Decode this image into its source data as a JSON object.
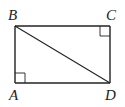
{
  "diagram": {
    "type": "rectangle-with-diagonal",
    "stroke_color": "#222222",
    "background": "#ffffff",
    "vertices": {
      "A": {
        "label": "A",
        "x": 15,
        "y": 83
      },
      "B": {
        "label": "B",
        "x": 15,
        "y": 26
      },
      "C": {
        "label": "C",
        "x": 110,
        "y": 26
      },
      "D": {
        "label": "D",
        "x": 110,
        "y": 83
      }
    },
    "segments": [
      "AB",
      "BC",
      "CD",
      "DA",
      "BD"
    ],
    "right_angle_marks": [
      "A",
      "C"
    ],
    "labels": {
      "A": "A",
      "B": "B",
      "C": "C",
      "D": "D"
    }
  }
}
